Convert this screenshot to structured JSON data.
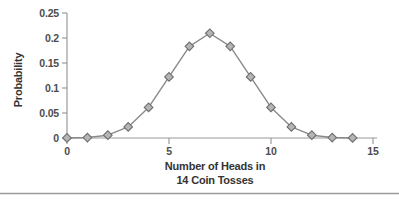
{
  "chart_data": {
    "type": "line",
    "title": "",
    "ylabel": "Probability",
    "xlabel_lines": [
      "Number of Heads in",
      "14 Coin Tosses"
    ],
    "x": [
      0,
      1,
      2,
      3,
      4,
      5,
      6,
      7,
      8,
      9,
      10,
      11,
      12,
      13,
      14
    ],
    "values": [
      0.0001,
      0.0009,
      0.0056,
      0.0222,
      0.0611,
      0.1222,
      0.1833,
      0.2095,
      0.1833,
      0.1222,
      0.0611,
      0.0222,
      0.0056,
      0.0009,
      0.0001
    ],
    "xlim": [
      0,
      15
    ],
    "ylim": [
      0,
      0.25
    ],
    "xticks": [
      {
        "v": 0,
        "label": "0"
      },
      {
        "v": 5,
        "label": "5"
      },
      {
        "v": 10,
        "label": "10"
      },
      {
        "v": 15,
        "label": "15"
      }
    ],
    "yticks": [
      {
        "v": 0,
        "label": "0"
      },
      {
        "v": 0.05,
        "label": "0.05"
      },
      {
        "v": 0.1,
        "label": "0.1"
      },
      {
        "v": 0.15,
        "label": "0.15"
      },
      {
        "v": 0.2,
        "label": "0.2"
      },
      {
        "v": 0.25,
        "label": "0.25"
      }
    ],
    "marker": "diamond",
    "legend": "none",
    "grid": "off",
    "colors": {
      "line": "#8a8a8a",
      "marker_fill": "#b5b5b5",
      "marker_stroke": "#6e6e6e",
      "axis": "#9a9a9a",
      "tick_text": "#4d4d4d",
      "title_text": "#333333",
      "divider": "#9a9a9a"
    }
  }
}
